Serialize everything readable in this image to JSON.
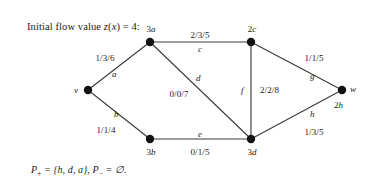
{
  "headline": {
    "prefix": "Initial flow value ",
    "func": "z",
    "arg_open": "(",
    "arg": "x",
    "arg_close": ")",
    "equals": " = ",
    "value": "4",
    "suffix": ":",
    "full": "Initial flow value z(x) = 4:"
  },
  "caption": {
    "p_plus_symbol": "P",
    "p_plus_sub": "+",
    "p_plus_eq": " = {h, d, a}, ",
    "p_minus_symbol": "P",
    "p_minus_sub": "−",
    "p_minus_eq": " = ∅.",
    "full": "P+ = {h, d, a}, P− = ∅."
  },
  "graph": {
    "line_color": "#3c3c3c",
    "node_color": "#111111",
    "nodes": [
      {
        "id": "v",
        "label": "v",
        "label_pos": "left",
        "x": 88,
        "y": 90,
        "lx": 80,
        "ly": 93
      },
      {
        "id": "a",
        "label": "3a",
        "label_pos": "above",
        "x": 150,
        "y": 42,
        "lx": 150,
        "ly": 30
      },
      {
        "id": "b",
        "label": "3b",
        "label_pos": "below",
        "x": 150,
        "y": 139,
        "lx": 150,
        "ly": 155
      },
      {
        "id": "c",
        "label": "2c",
        "label_pos": "above",
        "x": 251,
        "y": 42,
        "lx": 251,
        "ly": 30
      },
      {
        "id": "d",
        "label": "3d",
        "label_pos": "below",
        "x": 251,
        "y": 139,
        "lx": 251,
        "ly": 155
      },
      {
        "id": "w",
        "label": "w",
        "label_pos": "right",
        "x": 342,
        "y": 90,
        "lx": 352,
        "ly": 93
      },
      {
        "id": "w2",
        "label": "2h",
        "label_pos": "below",
        "x": 342,
        "y": 90,
        "lx": 344,
        "ly": 108
      }
    ],
    "edges": [
      {
        "id": "a",
        "name": "a",
        "value": "1/3/6",
        "from": "v",
        "to": "a"
      },
      {
        "id": "b",
        "name": "b",
        "value": "1/1/4",
        "from": "v",
        "to": "b"
      },
      {
        "id": "c",
        "name": "c",
        "value": "2/3/5",
        "from": "a",
        "to": "c"
      },
      {
        "id": "d",
        "name": "d",
        "value": "0/0/7",
        "from": "a",
        "to": "d"
      },
      {
        "id": "e",
        "name": "e",
        "value": "0/1/5",
        "from": "b",
        "to": "d"
      },
      {
        "id": "f",
        "name": "f",
        "value": "2/2/8",
        "from": "c",
        "to": "d"
      },
      {
        "id": "g",
        "name": "g",
        "value": "1/1/5",
        "from": "c",
        "to": "w"
      },
      {
        "id": "h",
        "name": "h",
        "value": "1/3/5",
        "from": "d",
        "to": "w"
      }
    ],
    "edge_name_labels": {
      "a": "a",
      "b": "b",
      "c": "c",
      "d": "d",
      "e": "e",
      "f": "f",
      "g": "g",
      "h": "h"
    },
    "edge_value_labels": {
      "a": "1/3/6",
      "b": "1/1/4",
      "c": "2/3/5",
      "d": "0/0/7",
      "e": "0/1/5",
      "f": "2/2/8",
      "g": "1/1/5",
      "h": "1/3/5"
    },
    "node_name_labels": {
      "v": "v",
      "a": "3a",
      "b": "3b",
      "c": "2c",
      "d": "3d",
      "w": "w",
      "w2": "2h"
    }
  }
}
